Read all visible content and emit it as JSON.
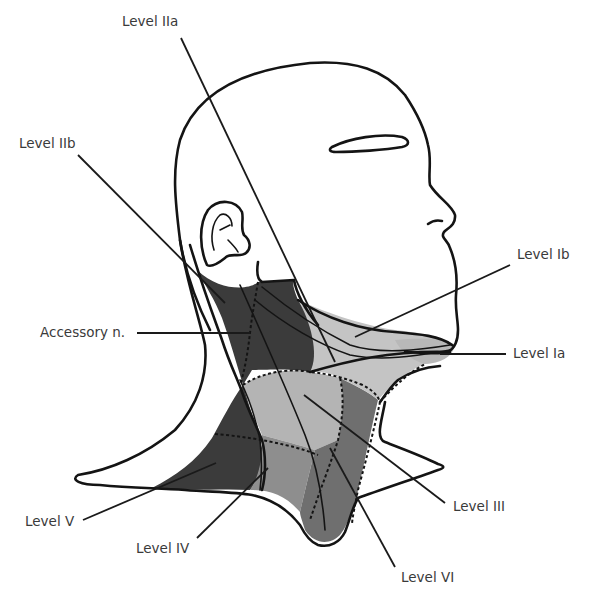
{
  "figure": {
    "colors": {
      "level_dark": "#3b3b3b",
      "level_mid": "#6f6f6f",
      "level_light": "#b4b4b4",
      "level_lighter": "#c4c4c4",
      "outline": "#141414",
      "label_text": "#3a3a3a"
    }
  },
  "labels": {
    "level_IIa": "Level IIa",
    "level_IIb": "Level IIb",
    "accessory_n": "Accessory n.",
    "level_Ib": "Level Ib",
    "level_Ia": "Level Ia",
    "level_V": "Level V",
    "level_IV": "Level IV",
    "level_III": "Level III",
    "level_VI": "Level VI"
  }
}
